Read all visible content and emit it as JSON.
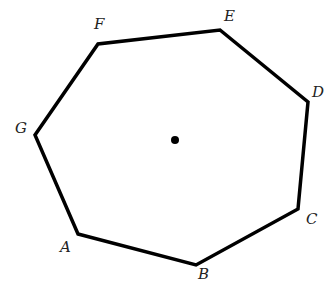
{
  "diagram": {
    "type": "heptagon",
    "stroke_color": "#000000",
    "stroke_width": 3.5,
    "center_dot": {
      "x": 175,
      "y": 140,
      "r": 4,
      "color": "#000000"
    },
    "vertices": [
      {
        "label": "A",
        "x": 78,
        "y": 234,
        "label_x": 60,
        "label_y": 252
      },
      {
        "label": "B",
        "x": 196,
        "y": 265,
        "label_x": 198,
        "label_y": 279
      },
      {
        "label": "C",
        "x": 298,
        "y": 209,
        "label_x": 306,
        "label_y": 224
      },
      {
        "label": "D",
        "x": 308,
        "y": 102,
        "label_x": 312,
        "label_y": 97
      },
      {
        "label": "E",
        "x": 220,
        "y": 30,
        "label_x": 224,
        "label_y": 21
      },
      {
        "label": "F",
        "x": 98,
        "y": 44,
        "label_x": 94,
        "label_y": 29
      },
      {
        "label": "G",
        "x": 35,
        "y": 135,
        "label_x": 15,
        "label_y": 133
      }
    ]
  }
}
